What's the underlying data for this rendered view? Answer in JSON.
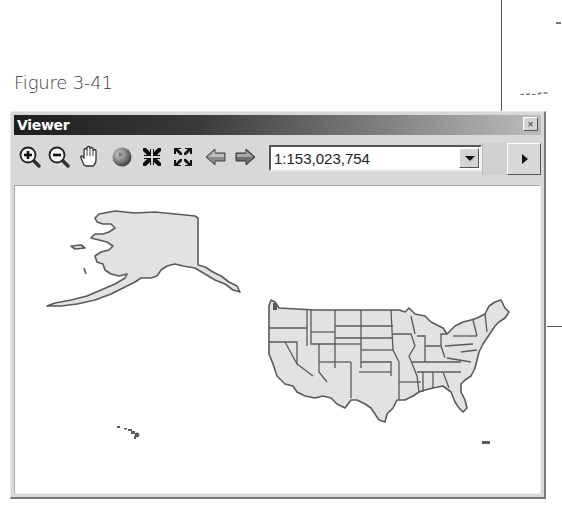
{
  "figure": {
    "caption": "Figure 3-41"
  },
  "window": {
    "title": "Viewer",
    "close_label": "×"
  },
  "toolbar": {
    "tools": [
      {
        "name": "zoom-in",
        "icon": "zoom-in-icon"
      },
      {
        "name": "zoom-out",
        "icon": "zoom-out-icon"
      },
      {
        "name": "pan",
        "icon": "hand-icon"
      },
      {
        "name": "full-extent",
        "icon": "globe-icon"
      },
      {
        "name": "fixed-zoom-in",
        "icon": "fixed-zoom-in-icon"
      },
      {
        "name": "fixed-zoom-out",
        "icon": "fixed-zoom-out-icon"
      },
      {
        "name": "back",
        "icon": "arrow-left-icon"
      },
      {
        "name": "forward",
        "icon": "arrow-right-icon"
      }
    ],
    "scale": "1:153,023,754"
  },
  "map": {
    "layers": [
      "Alaska",
      "Contiguous United States (states)",
      "Hawaii",
      "Puerto Rico"
    ],
    "fill_color": "#e2e2e2",
    "outline_color": "#5a5a5a"
  }
}
